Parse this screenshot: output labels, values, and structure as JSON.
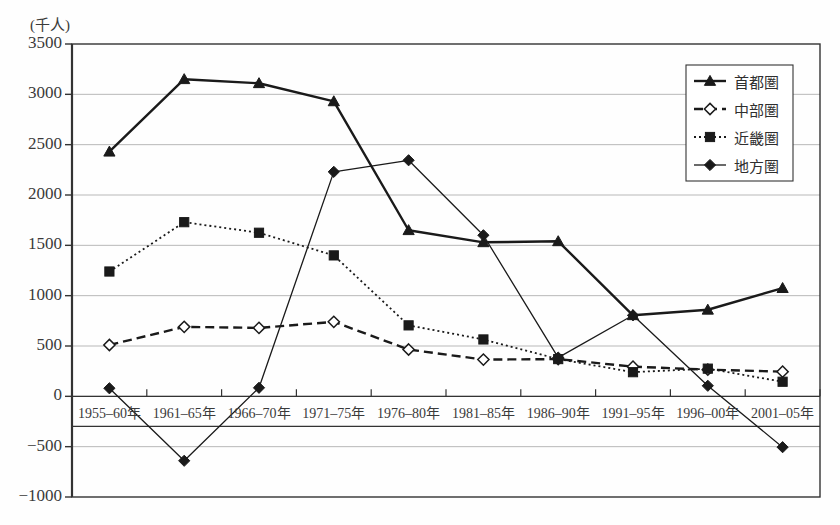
{
  "chart_data": {
    "type": "line",
    "title": "",
    "unit_label": "(千人)",
    "xlabel": "",
    "ylabel": "",
    "ylim": [
      -1000,
      3500
    ],
    "ytick_step": 500,
    "yticks": [
      "3500",
      "3000",
      "2500",
      "2000",
      "1500",
      "1000",
      "500",
      "0",
      "-500",
      "-1000"
    ],
    "ytick_values": [
      3500,
      3000,
      2500,
      2000,
      1500,
      1000,
      500,
      0,
      -500,
      -1000
    ],
    "grid": true,
    "legend_position": "top-right",
    "categories": [
      "1955-60年",
      "1961-65年",
      "1966-70年",
      "1971-75年",
      "1976-80年",
      "1981-85年",
      "1986-90年",
      "1991-95年",
      "1996-00年",
      "2001-05年"
    ],
    "series": [
      {
        "name": "首都圏",
        "marker": "triangle-filled",
        "line": "solid-thick",
        "values": [
          2430,
          3150,
          3110,
          2930,
          1650,
          1530,
          1540,
          805,
          860,
          1075
        ]
      },
      {
        "name": "中部圏",
        "marker": "diamond-open",
        "line": "dashed",
        "values": [
          510,
          690,
          680,
          740,
          465,
          365,
          370,
          295,
          265,
          245
        ]
      },
      {
        "name": "近畿圏",
        "marker": "square-filled",
        "line": "dotted",
        "values": [
          1240,
          1730,
          1625,
          1400,
          705,
          565,
          370,
          240,
          275,
          145
        ]
      },
      {
        "name": "地方圏",
        "marker": "diamond-filled",
        "line": "solid-thin",
        "values": [
          80,
          -640,
          85,
          2230,
          2345,
          1600,
          385,
          805,
          105,
          -505
        ]
      }
    ],
    "colors": {
      "axis": "#333333",
      "grid": "#b8b8b8",
      "series": "#1a1a1a",
      "background": "#fefefe"
    }
  }
}
